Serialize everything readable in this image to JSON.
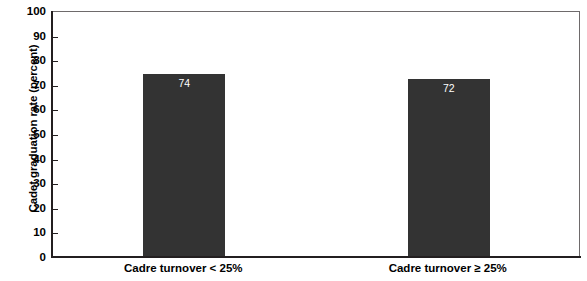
{
  "chart_data": {
    "type": "bar",
    "title": "",
    "xlabel": "",
    "ylabel": "Cadet graduation rate (percent)",
    "categories": [
      "Cadre turnover < 25%",
      "Cadre turnover ≥ 25%"
    ],
    "values": [
      74,
      72
    ],
    "value_labels": [
      "74",
      "72"
    ],
    "ylim": [
      0,
      100
    ],
    "yticks": [
      0,
      10,
      20,
      30,
      40,
      50,
      60,
      70,
      80,
      90,
      100
    ],
    "ytick_labels": [
      "0",
      "10",
      "20",
      "30",
      "40",
      "50",
      "60",
      "70",
      "80",
      "90",
      "100"
    ],
    "grid": false,
    "legend": null,
    "bar_color": "#333333",
    "value_label_color": "#ffffff",
    "axis_color": "#231f20",
    "background_color": "#ffffff"
  }
}
